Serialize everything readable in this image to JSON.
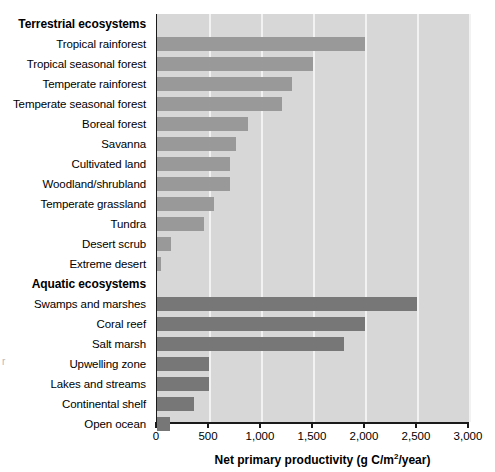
{
  "chart_data": {
    "type": "bar",
    "orientation": "horizontal",
    "title": "",
    "xlabel": "Net primary productivity (g C/m2/year)",
    "xlabel_display": "Net primary productivity (g C/m",
    "xlabel_sup": "2",
    "xlabel_tail": "/year)",
    "ylabel": "",
    "xlim": [
      0,
      3000
    ],
    "xticks": [
      0,
      500,
      1000,
      1500,
      2000,
      2500,
      3000
    ],
    "xticklabels": [
      "0",
      "500",
      "1,000",
      "1,500",
      "2,000",
      "2,500",
      "3,000"
    ],
    "grid": true,
    "legend": "none",
    "groups": [
      {
        "name": "Terrestrial ecosystems",
        "color": "#999999",
        "categories": [
          "Tropical rainforest",
          "Tropical seasonal forest",
          "Temperate rainforest",
          "Temperate seasonal forest",
          "Boreal forest",
          "Savanna",
          "Cultivated land",
          "Woodland/shrubland",
          "Temperate grassland",
          "Tundra",
          "Desert scrub",
          "Extreme desert"
        ],
        "values": [
          2000,
          1500,
          1300,
          1200,
          875,
          760,
          700,
          700,
          550,
          450,
          130,
          40
        ]
      },
      {
        "name": "Aquatic ecosystems",
        "color": "#777777",
        "categories": [
          "Swamps and marshes",
          "Coral reef",
          "Salt marsh",
          "Upwelling zone",
          "Lakes and streams",
          "Continental shelf",
          "Open ocean"
        ],
        "values": [
          2500,
          2000,
          1800,
          500,
          500,
          360,
          125
        ]
      }
    ]
  },
  "colors": {
    "plot_background": "#d7d7d7",
    "gridline": "#f2f2f2",
    "axis": "#1a1a1a",
    "terrestrial_bar": "#999999",
    "aquatic_bar": "#777777",
    "page_background": "#ffffff"
  }
}
